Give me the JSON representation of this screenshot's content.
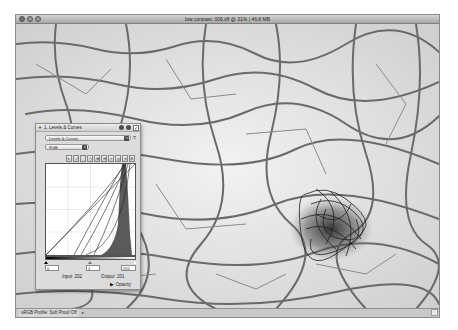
{
  "window": {
    "title": "low contrast: 006.tiff @ 31% | 46.8 MB",
    "traffic_lights": [
      "close",
      "minimize",
      "zoom"
    ]
  },
  "status_bar": {
    "text": "sRGB Profile: Soft Proof Off",
    "menu_arrow": "▸"
  },
  "panel": {
    "disclosure": "▼",
    "title": "1. Levels & Curves",
    "preset_select": "Levels & Curves",
    "channel_select": "RGB",
    "select_arrow": "▾",
    "header_check": "✓",
    "help_icon": "?",
    "tools": [
      "◐",
      "↗",
      "⌒",
      "✎",
      "⊕",
      "⊖",
      "⌖",
      "◎",
      "✕",
      "⚙"
    ],
    "graph": {
      "grid_lines": 4,
      "curves": "multiple steep tone curves with histogram"
    },
    "fields": {
      "black_point": "0",
      "gamma": "1",
      "white_point": "255"
    },
    "input_label": "Input: 202",
    "output_label": "Output: 201",
    "opacity_label": "Opacity",
    "opacity_arrow": "▶"
  },
  "colors": {
    "window_chrome": "#bdbdbd",
    "panel_bg": "#dcdcdc",
    "histogram": "#555555"
  }
}
